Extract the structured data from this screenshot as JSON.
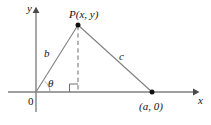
{
  "figure": {
    "kind": "geometry-diagram",
    "stroke_color": "#808080",
    "text_color": "#141414",
    "background_color": "#ffffff",
    "axes": {
      "x_label": "x",
      "y_label": "y",
      "origin_label": "0"
    },
    "points": {
      "P": {
        "label": "P(x, y)",
        "x": 78,
        "y": 25
      },
      "A": {
        "label": "(a, 0)",
        "x": 152,
        "y": 92
      },
      "O": {
        "label": "0",
        "x": 36,
        "y": 92
      },
      "foot": {
        "x": 78,
        "y": 92
      }
    },
    "sides": {
      "b": {
        "label": "b",
        "from": "O",
        "to": "P"
      },
      "c": {
        "label": "c",
        "from": "P",
        "to": "A"
      }
    },
    "angle": {
      "theta": "θ",
      "right_angle_marker": true
    },
    "altitude": {
      "style": "dashed",
      "from": "P",
      "to": "foot"
    }
  }
}
